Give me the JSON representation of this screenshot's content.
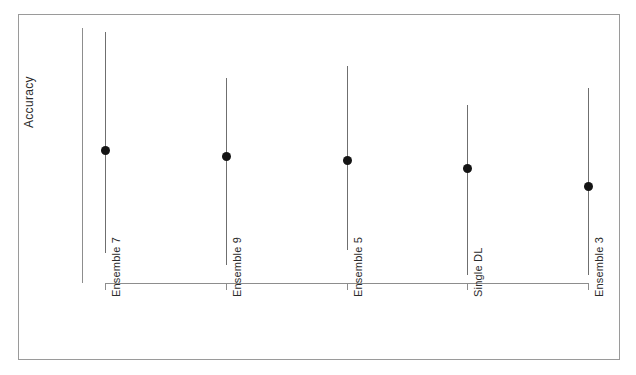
{
  "chart_data": {
    "type": "scatter",
    "title": "",
    "subtitle": "",
    "xlabel": "",
    "ylabel": "Accuracy",
    "grid": false,
    "legend": null,
    "orientation": "vertical",
    "marker": "filled-circle",
    "error_bars": "vertical-whisker-no-caps",
    "axis_ticks_shown": false,
    "ylim_note": "Y axis is unlabeled; no numeric tick values are printed on the axis.",
    "categories": [
      "Ensemble 7",
      "Ensemble 9",
      "Ensemble 5",
      "Single DL",
      "Ensemble 3"
    ],
    "series": [
      {
        "name": "Accuracy",
        "values": [
          0.523,
          0.498,
          0.482,
          0.451,
          0.38
        ],
        "error_low": [
          0.117,
          0.071,
          0.133,
          0.031,
          0.031
        ],
        "error_high": [
          0.463,
          0.306,
          0.368,
          0.247,
          0.384
        ],
        "points": [
          {
            "category": "Ensemble 7",
            "estimate": 0.523,
            "ci_low": 0.406,
            "ci_high": 0.986
          },
          {
            "category": "Ensemble 9",
            "estimate": 0.498,
            "ci_low": 0.427,
            "ci_high": 0.804
          },
          {
            "category": "Ensemble 5",
            "estimate": 0.482,
            "ci_low": 0.349,
            "ci_high": 0.85
          },
          {
            "category": "Single DL",
            "estimate": 0.451,
            "ci_low": 0.42,
            "ci_high": 0.698
          },
          {
            "category": "Ensemble 3",
            "estimate": 0.38,
            "ci_low": 0.349,
            "ci_high": 0.764
          }
        ]
      }
    ],
    "pixel_geometry": {
      "note": "Pixel coordinates read off the source raster; used for faithful redraw.",
      "plot_top_y": 28,
      "plot_baseline_y": 283,
      "items": [
        {
          "category": "Ensemble 7",
          "x": 105,
          "top_y": 32,
          "dot_y": 150,
          "bottom_y": 253
        },
        {
          "category": "Ensemble 9",
          "x": 226,
          "top_y": 78,
          "dot_y": 156,
          "bottom_y": 265
        },
        {
          "category": "Ensemble 5",
          "x": 347,
          "top_y": 66,
          "dot_y": 160,
          "bottom_y": 250
        },
        {
          "category": "Single DL",
          "x": 467,
          "top_y": 105,
          "dot_y": 168,
          "bottom_y": 275
        },
        {
          "category": "Ensemble 3",
          "x": 588,
          "top_y": 88,
          "dot_y": 186,
          "bottom_y": 275
        }
      ]
    },
    "colors": {
      "marker": "#141414",
      "errorbar": "#6f6f6f",
      "axis": "#8d8d8d",
      "frame": "#9a9a9a",
      "text": "#2b2b2b",
      "background": "#ffffff"
    }
  },
  "axis": {
    "y_title": "Accuracy"
  },
  "labels": {
    "c0": "Ensemble 7",
    "c1": "Ensemble 9",
    "c2": "Ensemble 5",
    "c3": "Single DL",
    "c4": "Ensemble 3"
  }
}
